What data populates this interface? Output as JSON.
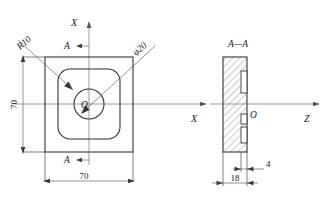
{
  "drawing": {
    "title": "Orthographic engineering drawing: square plate with rounded recess and central bore",
    "background_color": "#ffffff",
    "line_color": "#2a2a2a",
    "views": [
      {
        "name": "front-view",
        "label": "",
        "description": "square plate front view with rounded inner pocket and central circular hole"
      },
      {
        "name": "section-view",
        "label": "A—A",
        "description": "vertical section showing hatched material thickness with stepped slots"
      }
    ],
    "labels": {
      "axis_x_top": "X",
      "axis_x_mid": "X",
      "axis_z": "Z",
      "origin_front": "O",
      "origin_section": "O",
      "section_marker_top": "A",
      "section_marker_bottom": "A",
      "section_title": "A—A",
      "radius": "R10",
      "diameter": "φ20"
    },
    "dimensions": [
      {
        "name": "height-70",
        "value": "70",
        "orientation": "vertical",
        "view": "front-view"
      },
      {
        "name": "width-70",
        "value": "70",
        "orientation": "horizontal",
        "view": "front-view"
      },
      {
        "name": "slot-depth-4",
        "value": "4",
        "orientation": "horizontal",
        "view": "section-view"
      },
      {
        "name": "thickness-18",
        "value": "18",
        "orientation": "horizontal",
        "view": "section-view"
      }
    ]
  }
}
